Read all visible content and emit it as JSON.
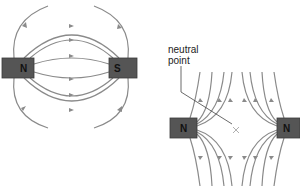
{
  "diagram": {
    "type": "magnetic-field-lines",
    "panels": [
      {
        "id": "attracting",
        "magnets": [
          {
            "pole": "N",
            "position": "left"
          },
          {
            "pole": "S",
            "position": "right"
          }
        ],
        "field_direction": "N to S"
      },
      {
        "id": "repelling",
        "magnets": [
          {
            "pole": "N",
            "position": "left"
          },
          {
            "pole": "N",
            "position": "right"
          }
        ],
        "neutral_point_label": "neutral point",
        "neutral_point_marker": "X"
      }
    ]
  },
  "labels": {
    "left_n": "N",
    "left_s": "S",
    "right_n1": "N",
    "right_n2": "N",
    "neutral_line1": "neutral",
    "neutral_line2": "point",
    "x_marker": "×"
  },
  "colors": {
    "field_line": "#8a8a8a",
    "magnet": "#555555",
    "text": "#111111"
  }
}
